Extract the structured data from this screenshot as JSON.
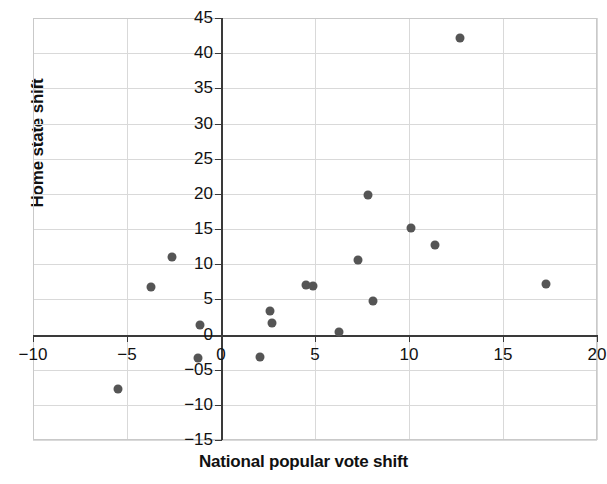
{
  "chart_data": {
    "type": "scatter",
    "title": "",
    "xlabel": "National popular vote shift",
    "ylabel": "Home state shift",
    "xlim": [
      -10,
      20
    ],
    "ylim": [
      -15,
      45
    ],
    "xticks": [
      -10,
      -5,
      0,
      5,
      10,
      15,
      20
    ],
    "yticks": [
      -15,
      -10,
      -5,
      0,
      5,
      10,
      15,
      20,
      25,
      30,
      35,
      40,
      45
    ],
    "xtick_labels": [
      "−10",
      "−5",
      "0",
      "5",
      "10",
      "15",
      "20"
    ],
    "ytick_labels": [
      "−15",
      "−10",
      "−05",
      "0",
      "5",
      "10",
      "15",
      "20",
      "25",
      "30",
      "35",
      "40",
      "45"
    ],
    "grid": true,
    "grid_color": "#d9d9d9",
    "legend": null,
    "marker_color": "#555555",
    "marker_shape": "circle",
    "axis_color": "#3a3a3a",
    "background": "#ffffff",
    "points": [
      {
        "x": -5.5,
        "y": -7.7
      },
      {
        "x": -3.7,
        "y": 6.7
      },
      {
        "x": -2.6,
        "y": 11.0
      },
      {
        "x": -1.1,
        "y": 1.3
      },
      {
        "x": -1.2,
        "y": -3.4
      },
      {
        "x": 2.1,
        "y": -3.2
      },
      {
        "x": 2.6,
        "y": 3.4
      },
      {
        "x": 2.7,
        "y": 1.7
      },
      {
        "x": 4.5,
        "y": 7.0
      },
      {
        "x": 4.9,
        "y": 6.9
      },
      {
        "x": 6.3,
        "y": 0.3
      },
      {
        "x": 7.3,
        "y": 10.6
      },
      {
        "x": 7.8,
        "y": 19.8
      },
      {
        "x": 8.1,
        "y": 4.8
      },
      {
        "x": 10.1,
        "y": 15.1
      },
      {
        "x": 11.4,
        "y": 12.7
      },
      {
        "x": 12.7,
        "y": 42.1
      },
      {
        "x": 17.3,
        "y": 7.2
      }
    ]
  }
}
